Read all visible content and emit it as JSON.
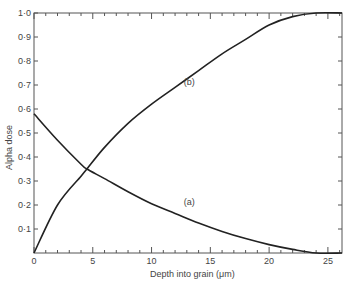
{
  "chart_data": {
    "type": "line",
    "title": "",
    "xlabel": "Depth into grain (μm)",
    "ylabel": "Alpha  dose",
    "xlim": [
      0,
      26.2
    ],
    "ylim": [
      0,
      1.0
    ],
    "grid": false,
    "legend": "none (curves labelled inline)",
    "x_ticks": [
      "0",
      "5",
      "10",
      "15",
      "20",
      "25"
    ],
    "y_ticks": [
      "0·1",
      "0·2",
      "0·3",
      "0·4",
      "0·5",
      "0·6",
      "0·7",
      "0·8",
      "0·9",
      "1·0"
    ],
    "series": [
      {
        "name": "(a)",
        "x": [
          0,
          2,
          4,
          4.5,
          6,
          8,
          10,
          12,
          14,
          16,
          18,
          20,
          22,
          24,
          26.2
        ],
        "values": [
          0.58,
          0.47,
          0.37,
          0.35,
          0.31,
          0.255,
          0.205,
          0.165,
          0.125,
          0.09,
          0.06,
          0.035,
          0.015,
          0.0,
          0.0
        ]
      },
      {
        "name": "(b)",
        "x": [
          0,
          2,
          4,
          4.5,
          6,
          8,
          10,
          12,
          14,
          16,
          18,
          20,
          22,
          24,
          26.2
        ],
        "values": [
          0.0,
          0.2,
          0.32,
          0.35,
          0.44,
          0.54,
          0.62,
          0.69,
          0.76,
          0.83,
          0.89,
          0.95,
          0.985,
          1.0,
          1.0
        ]
      }
    ],
    "annotations": [
      {
        "text": "(a)",
        "x": 13.2,
        "y": 0.2
      },
      {
        "text": "(b)",
        "x": 13.2,
        "y": 0.7
      }
    ]
  }
}
